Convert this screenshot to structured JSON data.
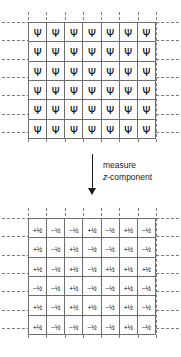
{
  "figure": {
    "type": "quantum-measurement-diagram",
    "columns": 7,
    "rows": 6,
    "top_grid": {
      "label": "wavefunction-grid",
      "symbol": "Ψ",
      "symbol_name": "psi-wavefunction-symbol",
      "cells": [
        [
          "Ψ",
          "Ψ",
          "Ψ",
          "Ψ",
          "Ψ",
          "Ψ",
          "Ψ"
        ],
        [
          "Ψ",
          "Ψ",
          "Ψ",
          "Ψ",
          "Ψ",
          "Ψ",
          "Ψ"
        ],
        [
          "Ψ",
          "Ψ",
          "Ψ",
          "Ψ",
          "Ψ",
          "Ψ",
          "Ψ"
        ],
        [
          "Ψ",
          "Ψ",
          "Ψ",
          "Ψ",
          "Ψ",
          "Ψ",
          "Ψ"
        ],
        [
          "Ψ",
          "Ψ",
          "Ψ",
          "Ψ",
          "Ψ",
          "Ψ",
          "Ψ"
        ],
        [
          "Ψ",
          "Ψ",
          "Ψ",
          "Ψ",
          "Ψ",
          "Ψ",
          "Ψ"
        ]
      ]
    },
    "transition": {
      "arrow": "down-arrow",
      "caption_line1": "measure",
      "caption_line2_italic": "z",
      "caption_line2_rest": "-component"
    },
    "bottom_grid": {
      "label": "spin-z-measurement-grid",
      "cells": [
        [
          "+½",
          "−½",
          "−½",
          "+½",
          "−½",
          "+½",
          "−½"
        ],
        [
          "+½",
          "−½",
          "+½",
          "−½",
          "−½",
          "+½",
          "−½"
        ],
        [
          "+½",
          "−½",
          "+½",
          "−½",
          "+½",
          "+½",
          "+½"
        ],
        [
          "−½",
          "−½",
          "+½",
          "−½",
          "−½",
          "+½",
          "−½"
        ],
        [
          "+½",
          "−½",
          "+½",
          "+½",
          "−½",
          "+½",
          "−½"
        ],
        [
          "+½",
          "−½",
          "−½",
          "−½",
          "−½",
          "+½",
          "−½"
        ]
      ]
    },
    "colors": {
      "cell_border": "#6e6e6e",
      "dashed_guide": "#7d7d7d",
      "text": "#000000",
      "arrow": "#1a1a1a",
      "background": "#ffffff"
    }
  }
}
